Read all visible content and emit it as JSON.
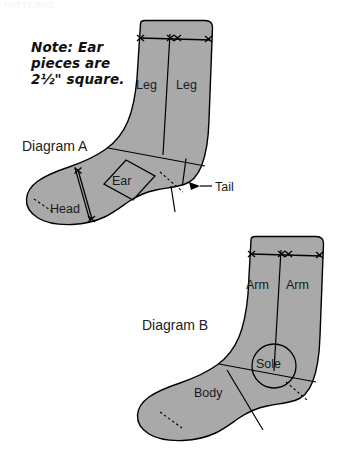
{
  "page": {
    "background_color": "#ffffff",
    "faint_top_text": "PATTERNS",
    "piece_fill_color": "#a9a9a9",
    "line_color": "#000000"
  },
  "note": {
    "line1": "Note: Ear",
    "line2": "pieces are",
    "line3": "2½\" square."
  },
  "diagram_a": {
    "caption": "Diagram A",
    "labels": {
      "leg_left": "Leg",
      "leg_right": "Leg",
      "ear": "Ear",
      "head": "Head",
      "tail": "Tail"
    }
  },
  "diagram_b": {
    "caption": "Diagram B",
    "labels": {
      "arm_left": "Arm",
      "arm_right": "Arm",
      "sole": "Sole",
      "body": "Body"
    }
  },
  "icons": {
    "x_mark": "x-mark-icon",
    "arrow": "arrow-left-icon",
    "dimension": "dimension-arrow-icon"
  }
}
